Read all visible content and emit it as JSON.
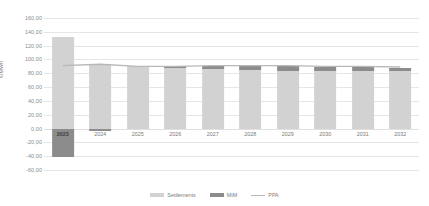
{
  "chart_data": {
    "type": "bar",
    "subtype": "stacked-bar-with-line",
    "title": "",
    "xlabel": "",
    "ylabel": "€/MWh",
    "ylim": [
      -60,
      160
    ],
    "ytick_step": 20,
    "grid": true,
    "legend_position": "bottom",
    "categories": [
      "2023",
      "2024",
      "2025",
      "2026",
      "2027",
      "2028",
      "2029",
      "2030",
      "2031",
      "2032"
    ],
    "highlighted_category": "2023",
    "ytick_labels": [
      "160,00",
      "140,00",
      "120,00",
      "100,00",
      "80,00",
      "60,00",
      "40,00",
      "20,00",
      "0,00",
      "-20,00",
      "-40,00",
      "-60,00"
    ],
    "ytick_values": [
      160,
      140,
      120,
      100,
      80,
      60,
      40,
      20,
      0,
      -20,
      -40,
      -60
    ],
    "series": [
      {
        "name": "Settlements",
        "type": "bar",
        "color": "#d2d2d2",
        "values": [
          133,
          94,
          90,
          88,
          86,
          85,
          84,
          84,
          83,
          83
        ]
      },
      {
        "name": "MtM",
        "type": "bar",
        "color": "#8c8c8c",
        "values": [
          -41,
          -3,
          0,
          2,
          4,
          5,
          6,
          5,
          6,
          5
        ]
      },
      {
        "name": "PPA",
        "type": "line",
        "color": "#b8b8b8",
        "values": [
          91,
          93,
          90,
          90,
          91,
          91,
          91,
          90,
          90,
          89
        ]
      }
    ],
    "legend": [
      {
        "label": "Settlements",
        "marker": "swatch",
        "color": "#d2d2d2"
      },
      {
        "label": "MtM",
        "marker": "swatch",
        "color": "#8c8c8c"
      },
      {
        "label": "PPA",
        "marker": "line",
        "color": "#b8b8b8"
      }
    ]
  }
}
